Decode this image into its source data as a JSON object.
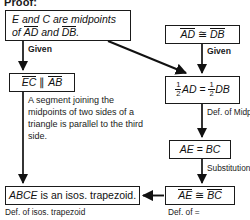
{
  "title": "Proof:",
  "boxes": {
    "given_midpoints": {
      "line1_pre": "E",
      "line1_mid": " and ",
      "line1_c": "C",
      "line1_post": " are midpoints",
      "line2_pre": "of ",
      "line2_seg1": "AD",
      "line2_mid": " and ",
      "line2_seg2": "DB",
      "line2_post": "."
    },
    "ad_cong_db": {
      "seg1": "AD",
      "rel": "≅",
      "seg2": "DB"
    },
    "ec_parallel_ab": {
      "seg1": "EC",
      "rel": "∥",
      "seg2": "AB"
    },
    "half_ad_eq_half_db": {
      "num1": "1",
      "den1": "2",
      "term1": "AD",
      "rel": "=",
      "num2": "1",
      "den2": "2",
      "term2": "DB"
    },
    "ae_eq_bc": {
      "left": "AE",
      "rel": "=",
      "right": "BC"
    },
    "ae_cong_bc": {
      "seg1": "AE",
      "rel": "≅",
      "seg2": "BC"
    },
    "conclusion": {
      "subject": "ABCE",
      "text": " is an isos. trapezoid."
    }
  },
  "labels": {
    "given_left": "Given",
    "given_right": "Given",
    "def_of_midpt": "Def. of Midpt.",
    "substitution": "Substitution",
    "def_of_isos_trapezoid": "Def. of isos. trapezoid",
    "def_of_equal": "Def. of ="
  },
  "justification_paragraph": "A segment joining the midpoints of two sides of a triangle is parallel to the third side.",
  "colors": {
    "ink": "#111111",
    "background": "#ffffff"
  }
}
